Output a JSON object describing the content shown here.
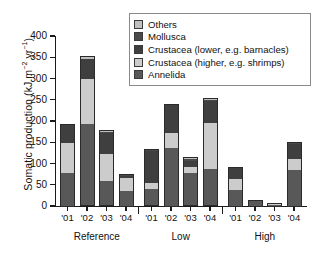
{
  "chart_data": {
    "type": "bar",
    "stacked": true,
    "title": "",
    "xlabel": "",
    "ylabel": "Somatic production (kJ m-2 yr-1)",
    "ylabel_parts": {
      "main": "Somatic production (kJ m",
      "sup1": "−2",
      "mid": " yr",
      "sup2": "−1",
      "tail": ")"
    },
    "ylim": [
      0,
      400
    ],
    "yticks": [
      0,
      50,
      100,
      150,
      200,
      250,
      300,
      350,
      400
    ],
    "grid": false,
    "legend_position": "top-right",
    "groups": [
      {
        "name": "Reference",
        "categories": [
          "'01",
          "'02",
          "'03",
          "'04"
        ]
      },
      {
        "name": "Low",
        "categories": [
          "'01",
          "'02",
          "'03",
          "'04"
        ]
      },
      {
        "name": "High",
        "categories": [
          "'01",
          "'02",
          "'03",
          "'04"
        ]
      }
    ],
    "categories": [
      "'01",
      "'02",
      "'03",
      "'04",
      "'01",
      "'02",
      "'03",
      "'04",
      "'01",
      "'02",
      "'03",
      "'04"
    ],
    "series": [
      {
        "name": "Annelida",
        "color": "#585858",
        "values": [
          78,
          192,
          58,
          37,
          41,
          138,
          78,
          86,
          39,
          12,
          4,
          86
        ]
      },
      {
        "name": "Crustacea (higher, e.g. shrimps)",
        "color": "#cccccc",
        "values": [
          72,
          106,
          64,
          31,
          12,
          34,
          14,
          110,
          25,
          2,
          1,
          26
        ]
      },
      {
        "name": "Crustacea (lower, e.g. barnacles)",
        "color": "#3f3f3f",
        "values": [
          41,
          47,
          50,
          5,
          77,
          66,
          15,
          52,
          27,
          1,
          1,
          36
        ]
      },
      {
        "name": "Mollusca",
        "color": "#4a4a4a",
        "values": [
          1,
          2,
          2,
          1,
          2,
          2,
          4,
          2,
          1,
          0,
          0,
          2
        ]
      },
      {
        "name": "Others",
        "color": "#bfbfbf",
        "values": [
          0,
          6,
          4,
          1,
          3,
          1,
          4,
          3,
          0,
          0,
          0,
          1
        ]
      }
    ],
    "totals": [
      192,
      353,
      178,
      75,
      135,
      241,
      115,
      253,
      92,
      15,
      6,
      151
    ]
  },
  "legend": {
    "items": [
      {
        "label": "Others",
        "color": "#bfbfbf"
      },
      {
        "label": "Mollusca",
        "color": "#4a4a4a"
      },
      {
        "label": "Crustacea (lower, e.g. barnacles)",
        "color": "#3f3f3f"
      },
      {
        "label": "Crustacea (higher, e.g. shrimps)",
        "color": "#cccccc"
      },
      {
        "label": "Annelida",
        "color": "#585858"
      }
    ]
  },
  "axis": {
    "y_tick_labels": [
      "0",
      "50",
      "100",
      "150",
      "200",
      "250",
      "300",
      "350",
      "400"
    ],
    "x_tick_labels": [
      "'01",
      "'02",
      "'03",
      "'04",
      "'01",
      "'02",
      "'03",
      "'04",
      "'01",
      "'02",
      "'03",
      "'04"
    ],
    "group_labels": [
      "Reference",
      "Low",
      "High"
    ]
  }
}
